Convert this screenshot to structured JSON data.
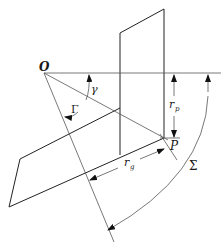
{
  "diagram": {
    "title": "",
    "labels": {
      "origin": "O",
      "point": "P",
      "gamma_small": "γ",
      "gamma_capital": "Γ",
      "sigma": "Σ",
      "rp": "r",
      "rp_sub": "p",
      "rg": "r",
      "rg_sub": "g"
    },
    "elements": [
      {
        "type": "point",
        "name": "O"
      },
      {
        "type": "point",
        "name": "P"
      },
      {
        "type": "plane",
        "name": "vertical-plane"
      },
      {
        "type": "plane",
        "name": "inclined-plane"
      },
      {
        "type": "dimension",
        "name": "r_p"
      },
      {
        "type": "dimension",
        "name": "r_g"
      },
      {
        "type": "angle",
        "name": "gamma"
      },
      {
        "type": "angle",
        "name": "Gamma"
      },
      {
        "type": "angle",
        "name": "Sigma"
      }
    ],
    "colors": {
      "stroke": "#222222",
      "background": "#ffffff"
    }
  }
}
